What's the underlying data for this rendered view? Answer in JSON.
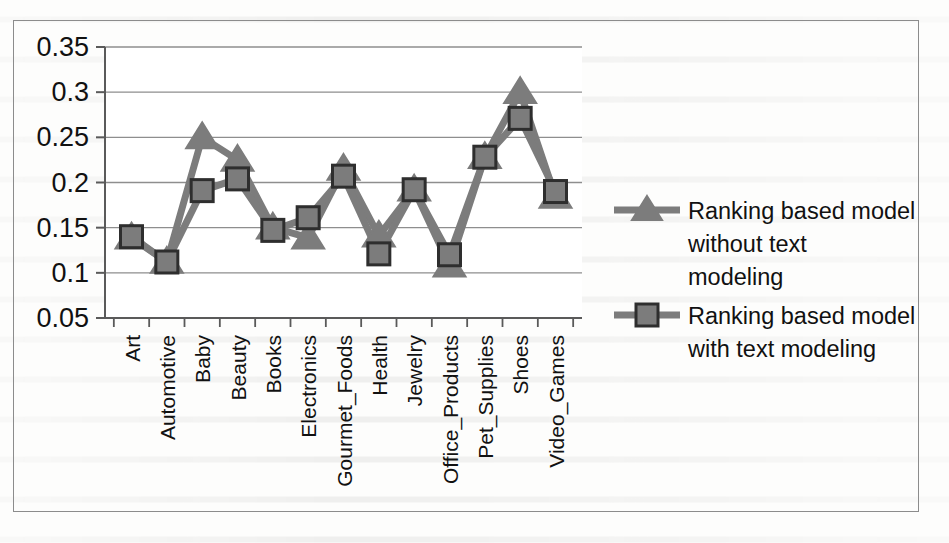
{
  "figure": {
    "frame_border_color": "#8c8c8c",
    "background_color": "#ffffff"
  },
  "chart_data": {
    "type": "line",
    "title": "",
    "xlabel": "",
    "ylabel": "",
    "ylim": [
      0.05,
      0.35
    ],
    "yticks": [
      "0.05",
      "0.1",
      "0.15",
      "0.2",
      "0.25",
      "0.3",
      "0.35"
    ],
    "ytick_values": [
      0.05,
      0.1,
      0.15,
      0.2,
      0.25,
      0.3,
      0.35
    ],
    "grid": true,
    "grid_axis": "y",
    "legend_position": "right",
    "categories": [
      "Art",
      "Automotive",
      "Baby",
      "Beauty",
      "Books",
      "Electronics",
      "Gourmet_Foods",
      "Health",
      "Jewelry",
      "Office_Products",
      "Pet_Supplies",
      "Shoes",
      "Video_Games"
    ],
    "series": [
      {
        "name": "Ranking based model without text modeling",
        "marker": "triangle",
        "color": "#7c7c7c",
        "edge_color": "#4a4a4a",
        "values": [
          0.139,
          0.112,
          0.25,
          0.225,
          0.15,
          0.139,
          0.215,
          0.141,
          0.192,
          0.108,
          0.228,
          0.3,
          0.184
        ]
      },
      {
        "name": "Ranking based model with text modeling",
        "marker": "square",
        "color": "#7c7c7c",
        "edge_color": "#2e2e2e",
        "values": [
          0.14,
          0.112,
          0.191,
          0.204,
          0.147,
          0.161,
          0.207,
          0.121,
          0.192,
          0.12,
          0.228,
          0.271,
          0.19
        ]
      }
    ]
  },
  "legend": {
    "entries": [
      {
        "marker": "triangle-marker",
        "label_lines": [
          "Ranking based model",
          "without text",
          "modeling"
        ],
        "label": "Ranking based model without text modeling"
      },
      {
        "marker": "square-marker",
        "label_lines": [
          "Ranking based model",
          "with text modeling"
        ],
        "label": "Ranking based model with text modeling"
      }
    ]
  }
}
